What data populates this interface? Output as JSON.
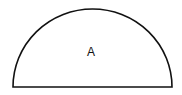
{
  "diagram": {
    "shape": "semicircle",
    "label": "A",
    "stroke_color": "#111111",
    "fill_color": "#ffffff"
  }
}
